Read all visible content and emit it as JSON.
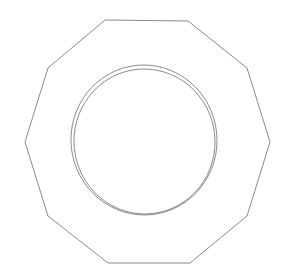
{
  "figure": {
    "background_color": "#ffffff",
    "stroke_color": "#8a8a8a",
    "stroke_width": 1,
    "canvas": {
      "width": 291,
      "height": 278
    }
  },
  "shapes": {
    "polygon": {
      "name": "decagon-outline",
      "sides": 10,
      "points": "105,20 188,21 247,68 270,142 247,216 190,263 108,263 48,216 25,142 48,68",
      "center": {
        "x": 146,
        "y": 141
      },
      "width": 245,
      "height": 243
    },
    "outer_circle": {
      "name": "outer-ring",
      "cx": 144,
      "cy": 140,
      "rx": 73,
      "ry": 75,
      "rotation": -6
    },
    "inner_circle": {
      "name": "inner-ring",
      "cx": 144.5,
      "cy": 141.5,
      "rx": 70.5,
      "ry": 72.5,
      "rotation": -6
    }
  }
}
